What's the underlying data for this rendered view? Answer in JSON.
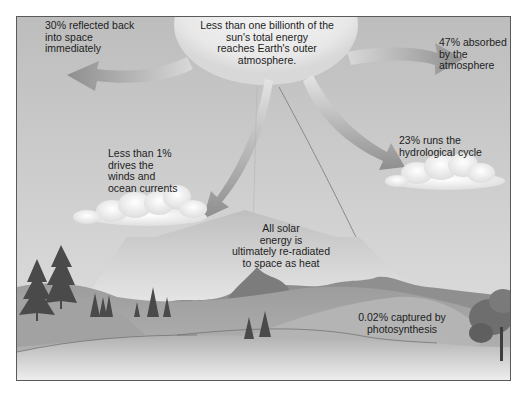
{
  "diagram": {
    "labels": {
      "sun": "Less than one billionth of the\nsun's total energy\nreaches Earth's outer\natmosphere.",
      "reflected": "30% reflected back\ninto space\nimmediately",
      "absorbed": "47% absorbed\nby the\natmosphere",
      "hydrological": "23% runs the\nhydrological cycle",
      "winds": "Less than 1%\ndrives the\nwinds and\nocean currents",
      "reradiated": "All solar\nenergy is\nultimately re-radiated\nto space as heat",
      "photosynthesis": "0.02% captured by\nphotosynthesis"
    },
    "flows": [
      {
        "name": "reflected",
        "percent": "30%",
        "direction": "left"
      },
      {
        "name": "absorbed",
        "percent": "47%",
        "direction": "right"
      },
      {
        "name": "hydrological",
        "percent": "23%",
        "direction": "down-right"
      },
      {
        "name": "winds",
        "percent": "<1%",
        "direction": "down-left"
      },
      {
        "name": "photosynthesis",
        "percent": "0.02%",
        "direction": "down"
      },
      {
        "name": "reradiated",
        "percent": "100%",
        "direction": "up"
      }
    ],
    "colors": {
      "sky": "#c9c9c9",
      "sun": "#ececec",
      "arrow": "#9a9a9a",
      "hill": "#a8a8a8",
      "text": "#1d1d1d",
      "border": "#5a5a5a"
    }
  }
}
